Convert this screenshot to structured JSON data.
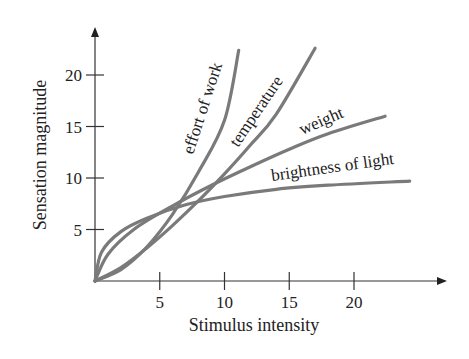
{
  "chart_data": {
    "type": "line",
    "title": "",
    "xlabel": "Stimulus intensity",
    "ylabel": "Sensation magnitude",
    "xlim": [
      0,
      26
    ],
    "ylim": [
      0,
      24
    ],
    "x_ticks": [
      5,
      10,
      15,
      20
    ],
    "y_ticks": [
      5,
      10,
      15,
      20
    ],
    "grid": false,
    "legend": "inline labels on curves",
    "colors": {
      "curve": "#7a7a7a",
      "axis": "#333333",
      "text": "#222222"
    },
    "series": [
      {
        "name": "effort of work",
        "x": [
          0,
          2,
          4,
          6,
          8,
          10,
          11.1
        ],
        "y": [
          0,
          1.1,
          3.3,
          6.5,
          10.6,
          15.6,
          22.4
        ]
      },
      {
        "name": "temperature",
        "x": [
          0,
          2,
          4,
          6,
          8,
          10,
          12,
          14,
          17.0
        ],
        "y": [
          0,
          1.3,
          3.2,
          5.4,
          7.8,
          10.4,
          13.2,
          16.2,
          22.6
        ]
      },
      {
        "name": "weight",
        "x": [
          0,
          1,
          3,
          6,
          9,
          12,
          15,
          18,
          22.4
        ],
        "y": [
          0,
          2.6,
          5.0,
          7.3,
          9.3,
          11.1,
          12.8,
          14.3,
          16.0
        ]
      },
      {
        "name": "brightness of light",
        "x": [
          0,
          0.5,
          2,
          4,
          7,
          10,
          14,
          18,
          24.3
        ],
        "y": [
          0,
          2.8,
          4.8,
          6.1,
          7.4,
          8.2,
          8.9,
          9.3,
          9.7
        ]
      }
    ]
  },
  "axes": {
    "x_title": "Stimulus intensity",
    "y_title": "Sensation magnitude",
    "x_tick_labels": [
      "5",
      "10",
      "15",
      "20"
    ],
    "y_tick_labels": [
      "5",
      "10",
      "15",
      "20"
    ]
  },
  "labels": {
    "effort": "effort of work",
    "temperature": "temperature",
    "weight": "weight",
    "brightness": "brightness of light"
  }
}
